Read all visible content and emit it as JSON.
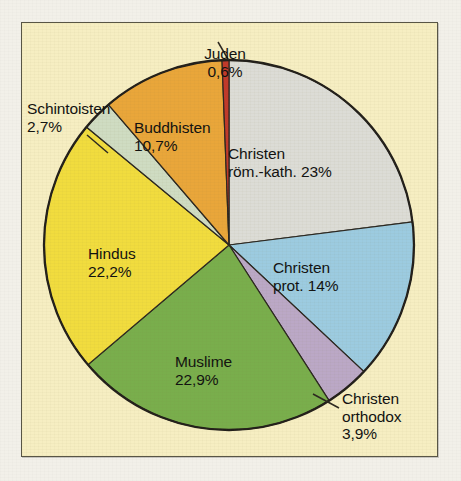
{
  "figure": {
    "background_color": "#f2f0e9",
    "panel_color": "#f6eec2",
    "panel_border_color": "#585545"
  },
  "chart_data": {
    "type": "pie",
    "title": "",
    "subtitle": "",
    "xlabel": "",
    "ylabel": "",
    "legend_position": "none",
    "grid": false,
    "units": "percent",
    "decimal_separator": ",",
    "start_angle_deg": 0,
    "direction": "clockwise",
    "categories": [
      "Christen röm.-kath.",
      "Christen prot.",
      "Christen orthodox",
      "Muslime",
      "Hindus",
      "Schintoisten",
      "Buddhisten",
      "Juden"
    ],
    "values": [
      23,
      14,
      3.9,
      22.9,
      22.2,
      2.7,
      10.7,
      0.6
    ],
    "colors": [
      "#dcdcd6",
      "#9ccbe0",
      "#bba8c6",
      "#79ae4c",
      "#f1dc3e",
      "#cfdcc2",
      "#e9a63a",
      "#c2392a"
    ],
    "slices": [
      {
        "name": "Christen röm.-kath.",
        "value": 23,
        "color": "#dcdcd6",
        "label_line1": "Christen",
        "label_line2": "röm.-kath. 23%",
        "label_placement": "inside",
        "has_leader_line": false
      },
      {
        "name": "Christen prot.",
        "value": 14,
        "color": "#9ccbe0",
        "label_line1": "Christen",
        "label_line2": "prot. 14%",
        "label_placement": "inside",
        "has_leader_line": false
      },
      {
        "name": "Christen orthodox",
        "value": 3.9,
        "color": "#bba8c6",
        "label_line1": "Christen",
        "label_line2": "orthodox",
        "label_line3": "3,9%",
        "label_placement": "outside",
        "has_leader_line": true
      },
      {
        "name": "Muslime",
        "value": 22.9,
        "color": "#79ae4c",
        "label_line1": "Muslime",
        "label_line2": "22,9%",
        "label_placement": "inside",
        "has_leader_line": false
      },
      {
        "name": "Hindus",
        "value": 22.2,
        "color": "#f1dc3e",
        "label_line1": "Hindus",
        "label_line2": "22,2%",
        "label_placement": "inside",
        "has_leader_line": false
      },
      {
        "name": "Schintoisten",
        "value": 2.7,
        "color": "#cfdcc2",
        "label_line1": "Schintoisten",
        "label_line2": "2,7%",
        "label_placement": "outside",
        "has_leader_line": true
      },
      {
        "name": "Buddhisten",
        "value": 10.7,
        "color": "#e9a63a",
        "label_line1": "Buddhisten",
        "label_line2": "10,7%",
        "label_placement": "inside",
        "has_leader_line": false
      },
      {
        "name": "Juden",
        "value": 0.6,
        "color": "#c2392a",
        "label_line1": "Juden",
        "label_line2": "0,6%",
        "label_placement": "outside",
        "has_leader_line": true
      }
    ]
  },
  "labels": {
    "juden": {
      "line1": "Juden",
      "line2": "0,6%"
    },
    "schintoisten": {
      "line1": "Schintoisten",
      "line2": "2,7%"
    },
    "buddhisten": {
      "line1": "Buddhisten",
      "line2": "10,7%"
    },
    "hindus": {
      "line1": "Hindus",
      "line2": "22,2%"
    },
    "muslime": {
      "line1": "Muslime",
      "line2": "22,9%"
    },
    "christen_kath": {
      "line1": "Christen",
      "line2": "röm.-kath. 23%"
    },
    "christen_prot": {
      "line1": "Christen",
      "line2": "prot. 14%"
    },
    "christen_orthodox": {
      "line1": "Christen",
      "line2": "orthodox",
      "line3": "3,9%"
    }
  }
}
